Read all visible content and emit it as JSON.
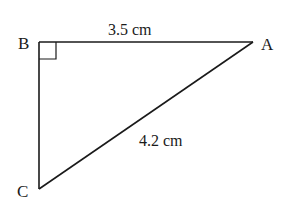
{
  "diagram": {
    "type": "right-triangle",
    "vertices": {
      "A": {
        "label": "A"
      },
      "B": {
        "label": "B"
      },
      "C": {
        "label": "C"
      }
    },
    "right_angle_at": "B",
    "sides": {
      "AB": {
        "label": "3.5 cm"
      },
      "AC": {
        "label": "4.2 cm"
      }
    },
    "colors": {
      "stroke": "#1a1a1a",
      "background": "#ffffff"
    }
  }
}
